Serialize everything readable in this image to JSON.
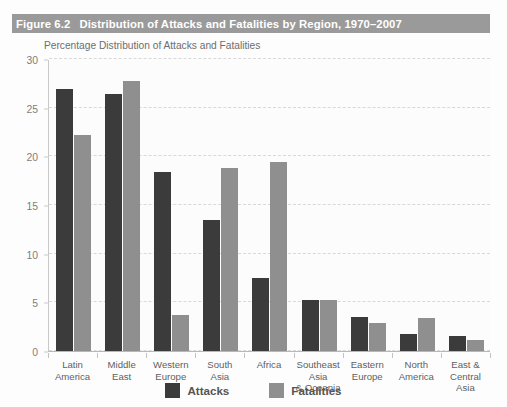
{
  "figure": {
    "number": "Figure 6.2",
    "title": "Distribution of Attacks and Fatalities by Region, 1970–2007",
    "subtitle": "Percentage Distribution of Attacks and Fatalities"
  },
  "legend": {
    "items": [
      {
        "label": "Attacks",
        "color": "#3b3b3b",
        "swatch": "attacks-swatch"
      },
      {
        "label": "Fatalities",
        "color": "#8f8f8f",
        "swatch": "fatalities-swatch"
      }
    ]
  },
  "colors": {
    "title_band": "#9a9a9a",
    "title_text": "#ffffff",
    "attacks": "#3b3b3b",
    "fatalities": "#8f8f8f",
    "gridline": "#d8d8d8",
    "axis": "#c9c9c9",
    "tick_label": "#7d7d7d",
    "category_label": "#5f5f5f",
    "subtitle": "#6d6d6d",
    "plot_background": "#fcfcfc"
  },
  "chart_data": {
    "type": "bar",
    "title": "Distribution of Attacks and Fatalities by Region, 1970–2007",
    "subtitle": "Percentage Distribution of Attacks and Fatalities",
    "xlabel": "",
    "ylabel": "",
    "ylim": [
      0,
      30
    ],
    "yticks": [
      0,
      5,
      10,
      15,
      20,
      25,
      30
    ],
    "ytick_labels": [
      "0",
      "5",
      "10",
      "15",
      "20",
      "25",
      "30"
    ],
    "grid": true,
    "grid_axis": "y",
    "legend_position": "bottom-center",
    "categories": [
      "Latin America",
      "Middle East",
      "Western Europe",
      "South Asia",
      "Africa",
      "Southeast Asia & Oceania",
      "Eastern Europe",
      "North America",
      "East & Central Asia"
    ],
    "category_label_lines": [
      [
        "Latin",
        "America"
      ],
      [
        "Middle",
        "East"
      ],
      [
        "Western",
        "Europe"
      ],
      [
        "South",
        "Asia"
      ],
      [
        "Africa"
      ],
      [
        "Southeast",
        "Asia",
        "& Oceania"
      ],
      [
        "Eastern",
        "Europe"
      ],
      [
        "North",
        "America"
      ],
      [
        "East &",
        "Central",
        "Asia"
      ]
    ],
    "series": [
      {
        "name": "Attacks",
        "color": "#3b3b3b",
        "values": [
          26.9,
          26.4,
          18.4,
          13.5,
          7.5,
          5.2,
          3.5,
          1.7,
          1.5
        ]
      },
      {
        "name": "Fatalities",
        "color": "#8f8f8f",
        "values": [
          22.2,
          27.7,
          3.7,
          18.8,
          19.4,
          5.2,
          2.9,
          3.4,
          1.1
        ]
      }
    ]
  }
}
